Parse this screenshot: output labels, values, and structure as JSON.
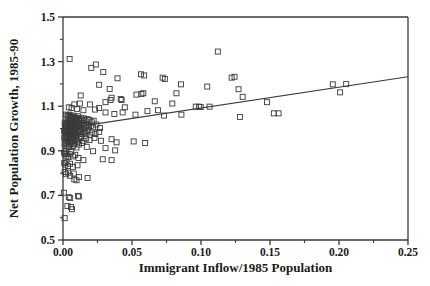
{
  "chart_data": {
    "type": "scatter",
    "title": "",
    "xlabel": "Immigrant Inflow/1985 Population",
    "ylabel": "Net Population Growth, 1985-90",
    "xlim": [
      0.0,
      0.25
    ],
    "ylim": [
      0.5,
      1.5
    ],
    "xticks": [
      0.0,
      0.05,
      0.1,
      0.15,
      0.2,
      0.25
    ],
    "xticklabels": [
      "0.00",
      "0.05",
      "0.10",
      "0.15",
      "0.20",
      "0.25"
    ],
    "yticks": [
      0.5,
      0.7,
      0.9,
      1.1,
      1.3,
      1.5
    ],
    "yticklabels": [
      "0.5",
      "0.7",
      "0.9",
      "1.1",
      "1.3",
      "1.5"
    ],
    "minor_xticks": [
      0.025,
      0.075,
      0.125,
      0.175,
      0.225
    ],
    "minor_yticks": [
      0.6,
      0.8,
      1.0,
      1.2,
      1.4
    ],
    "grid": false,
    "legend": null,
    "marker": "open-square",
    "marker_color": "#3a3a3a",
    "marker_size": 5,
    "line_color": "#3a3a3a",
    "axis_color": "#3a3a3a",
    "series": [
      {
        "name": "regression-line",
        "type": "line",
        "x": [
          0.0,
          0.25
        ],
        "y": [
          0.998,
          1.232
        ]
      },
      {
        "name": "cities",
        "type": "scatter",
        "points": [
          [
            0.0048,
            1.312
          ],
          [
            0.0205,
            1.272
          ],
          [
            0.0238,
            1.287
          ],
          [
            0.0292,
            1.253
          ],
          [
            0.0395,
            1.225
          ],
          [
            0.0565,
            1.243
          ],
          [
            0.0588,
            1.238
          ],
          [
            0.0722,
            1.228
          ],
          [
            0.0738,
            1.222
          ],
          [
            0.1122,
            1.345
          ],
          [
            0.1222,
            1.228
          ],
          [
            0.1243,
            1.232
          ],
          [
            0.0262,
            1.196
          ],
          [
            0.0338,
            1.177
          ],
          [
            0.0855,
            1.198
          ],
          [
            0.1045,
            1.188
          ],
          [
            0.1272,
            1.176
          ],
          [
            0.1955,
            1.198
          ],
          [
            0.2052,
            1.199
          ],
          [
            0.2008,
            1.162
          ],
          [
            0.0128,
            1.148
          ],
          [
            0.0352,
            1.138
          ],
          [
            0.0532,
            1.152
          ],
          [
            0.0568,
            1.155
          ],
          [
            0.0582,
            1.158
          ],
          [
            0.0822,
            1.158
          ],
          [
            0.1302,
            1.142
          ],
          [
            0.0082,
            1.108
          ],
          [
            0.0122,
            1.112
          ],
          [
            0.0195,
            1.108
          ],
          [
            0.0308,
            1.118
          ],
          [
            0.0345,
            1.128
          ],
          [
            0.0418,
            1.132
          ],
          [
            0.0425,
            1.128
          ],
          [
            0.0665,
            1.122
          ],
          [
            0.0792,
            1.112
          ],
          [
            0.1478,
            1.118
          ],
          [
            0.0042,
            1.095
          ],
          [
            0.0062,
            1.092
          ],
          [
            0.0102,
            1.088
          ],
          [
            0.0148,
            1.082
          ],
          [
            0.0232,
            1.085
          ],
          [
            0.0262,
            1.092
          ],
          [
            0.0308,
            1.072
          ],
          [
            0.0372,
            1.065
          ],
          [
            0.0432,
            1.072
          ],
          [
            0.0448,
            1.095
          ],
          [
            0.0525,
            1.062
          ],
          [
            0.0612,
            1.078
          ],
          [
            0.0688,
            1.082
          ],
          [
            0.0732,
            1.058
          ],
          [
            0.0858,
            1.062
          ],
          [
            0.0962,
            1.098
          ],
          [
            0.0985,
            1.098
          ],
          [
            0.0998,
            1.096
          ],
          [
            0.1062,
            1.098
          ],
          [
            0.1282,
            1.052
          ],
          [
            0.1528,
            1.068
          ],
          [
            0.1562,
            1.068
          ],
          [
            0.0022,
            1.062
          ],
          [
            0.0032,
            1.058
          ],
          [
            0.0038,
            1.055
          ],
          [
            0.0045,
            1.062
          ],
          [
            0.0052,
            1.058
          ],
          [
            0.0058,
            1.048
          ],
          [
            0.0062,
            1.052
          ],
          [
            0.0068,
            1.045
          ],
          [
            0.0072,
            1.058
          ],
          [
            0.0078,
            1.042
          ],
          [
            0.0082,
            1.052
          ],
          [
            0.0088,
            1.048
          ],
          [
            0.0095,
            1.038
          ],
          [
            0.0102,
            1.045
          ],
          [
            0.0108,
            1.055
          ],
          [
            0.0115,
            1.042
          ],
          [
            0.0122,
            1.035
          ],
          [
            0.0132,
            1.048
          ],
          [
            0.0142,
            1.038
          ],
          [
            0.0152,
            1.045
          ],
          [
            0.0165,
            1.032
          ],
          [
            0.0178,
            1.042
          ],
          [
            0.0192,
            1.038
          ],
          [
            0.0208,
            1.028
          ],
          [
            0.0222,
            1.035
          ],
          [
            0.0012,
            1.022
          ],
          [
            0.0018,
            1.028
          ],
          [
            0.0022,
            1.015
          ],
          [
            0.0028,
            1.025
          ],
          [
            0.0032,
            1.018
          ],
          [
            0.0038,
            1.028
          ],
          [
            0.0042,
            1.012
          ],
          [
            0.0048,
            1.022
          ],
          [
            0.0052,
            1.018
          ],
          [
            0.0058,
            1.025
          ],
          [
            0.0062,
            1.008
          ],
          [
            0.0068,
            1.018
          ],
          [
            0.0072,
            1.022
          ],
          [
            0.0078,
            1.012
          ],
          [
            0.0082,
            1.025
          ],
          [
            0.0088,
            1.015
          ],
          [
            0.0092,
            1.005
          ],
          [
            0.0098,
            1.018
          ],
          [
            0.0105,
            1.012
          ],
          [
            0.0112,
            1.022
          ],
          [
            0.0118,
            1.008
          ],
          [
            0.0125,
            1.015
          ],
          [
            0.0132,
            1.005
          ],
          [
            0.0142,
            1.018
          ],
          [
            0.0152,
            1.012
          ],
          [
            0.0162,
            1.002
          ],
          [
            0.0175,
            1.015
          ],
          [
            0.0188,
            1.008
          ],
          [
            0.0202,
            1.012
          ],
          [
            0.0218,
            1.005
          ],
          [
            0.0242,
            1.018
          ],
          [
            0.0268,
            1.002
          ],
          [
            0.0008,
            0.988
          ],
          [
            0.0014,
            0.995
          ],
          [
            0.0019,
            0.982
          ],
          [
            0.0024,
            0.992
          ],
          [
            0.0029,
            0.985
          ],
          [
            0.0034,
            0.995
          ],
          [
            0.0039,
            0.978
          ],
          [
            0.0044,
            0.988
          ],
          [
            0.0049,
            0.998
          ],
          [
            0.0054,
            0.982
          ],
          [
            0.0059,
            0.992
          ],
          [
            0.0064,
            0.985
          ],
          [
            0.0069,
            0.975
          ],
          [
            0.0074,
            0.988
          ],
          [
            0.0079,
            0.995
          ],
          [
            0.0084,
            0.978
          ],
          [
            0.0089,
            0.988
          ],
          [
            0.0094,
            0.982
          ],
          [
            0.0099,
            0.972
          ],
          [
            0.0106,
            0.985
          ],
          [
            0.0114,
            0.992
          ],
          [
            0.0122,
            0.978
          ],
          [
            0.0131,
            0.988
          ],
          [
            0.0141,
            0.975
          ],
          [
            0.0152,
            0.985
          ],
          [
            0.0164,
            0.978
          ],
          [
            0.0178,
            0.988
          ],
          [
            0.0194,
            0.972
          ],
          [
            0.0212,
            0.982
          ],
          [
            0.0235,
            0.975
          ],
          [
            0.0262,
            0.985
          ],
          [
            0.0009,
            0.958
          ],
          [
            0.0016,
            0.965
          ],
          [
            0.0023,
            0.952
          ],
          [
            0.0029,
            0.962
          ],
          [
            0.0035,
            0.948
          ],
          [
            0.0041,
            0.958
          ],
          [
            0.0047,
            0.968
          ],
          [
            0.0053,
            0.952
          ],
          [
            0.0059,
            0.962
          ],
          [
            0.0066,
            0.945
          ],
          [
            0.0073,
            0.958
          ],
          [
            0.0081,
            0.965
          ],
          [
            0.0089,
            0.948
          ],
          [
            0.0098,
            0.958
          ],
          [
            0.0108,
            0.942
          ],
          [
            0.0119,
            0.955
          ],
          [
            0.0132,
            0.962
          ],
          [
            0.0148,
            0.945
          ],
          [
            0.0168,
            0.955
          ],
          [
            0.0192,
            0.948
          ],
          [
            0.0228,
            0.958
          ],
          [
            0.0275,
            0.945
          ],
          [
            0.0352,
            0.952
          ],
          [
            0.0388,
            0.938
          ],
          [
            0.0512,
            0.942
          ],
          [
            0.0595,
            0.935
          ],
          [
            0.0011,
            0.928
          ],
          [
            0.0019,
            0.935
          ],
          [
            0.0027,
            0.922
          ],
          [
            0.0035,
            0.932
          ],
          [
            0.0043,
            0.918
          ],
          [
            0.0052,
            0.928
          ],
          [
            0.0061,
            0.938
          ],
          [
            0.0072,
            0.922
          ],
          [
            0.0084,
            0.932
          ],
          [
            0.0098,
            0.915
          ],
          [
            0.0115,
            0.928
          ],
          [
            0.0138,
            0.935
          ],
          [
            0.0172,
            0.918
          ],
          [
            0.0218,
            0.898
          ],
          [
            0.0308,
            0.912
          ],
          [
            0.0378,
            0.902
          ],
          [
            0.0008,
            0.892
          ],
          [
            0.0013,
            0.885
          ],
          [
            0.0018,
            0.898
          ],
          [
            0.0024,
            0.878
          ],
          [
            0.0031,
            0.888
          ],
          [
            0.0039,
            0.872
          ],
          [
            0.0048,
            0.885
          ],
          [
            0.0059,
            0.895
          ],
          [
            0.0072,
            0.875
          ],
          [
            0.0089,
            0.882
          ],
          [
            0.0112,
            0.868
          ],
          [
            0.0148,
            0.858
          ],
          [
            0.0288,
            0.862
          ],
          [
            0.0352,
            0.858
          ],
          [
            0.0009,
            0.845
          ],
          [
            0.0016,
            0.838
          ],
          [
            0.0025,
            0.848
          ],
          [
            0.0036,
            0.832
          ],
          [
            0.0051,
            0.842
          ],
          [
            0.0072,
            0.828
          ],
          [
            0.0105,
            0.835
          ],
          [
            0.0012,
            0.805
          ],
          [
            0.0022,
            0.795
          ],
          [
            0.0035,
            0.802
          ],
          [
            0.0052,
            0.788
          ],
          [
            0.0078,
            0.798
          ],
          [
            0.0115,
            0.782
          ],
          [
            0.0082,
            0.772
          ],
          [
            0.0098,
            0.768
          ],
          [
            0.0178,
            0.778
          ],
          [
            0.0006,
            0.712
          ],
          [
            0.0042,
            0.692
          ],
          [
            0.0052,
            0.688
          ],
          [
            0.0108,
            0.698
          ],
          [
            0.0115,
            0.695
          ],
          [
            0.0032,
            0.652
          ],
          [
            0.0058,
            0.648
          ],
          [
            0.0065,
            0.638
          ],
          [
            0.0012,
            0.598
          ]
        ]
      }
    ]
  }
}
